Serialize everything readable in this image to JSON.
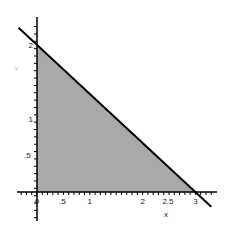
{
  "chart_data": {
    "type": "area",
    "title": "",
    "xlabel": "x",
    "ylabel": "y",
    "xlim": [
      -0.4,
      3.4
    ],
    "ylim": [
      -0.4,
      2.4
    ],
    "grid": false,
    "legend": null,
    "x_ticks": [
      {
        "value": 0,
        "label": "0"
      },
      {
        "value": 0.5,
        "label": ".5"
      },
      {
        "value": 1,
        "label": "1"
      },
      {
        "value": 2,
        "label": "2"
      },
      {
        "value": 2.5,
        "label": "2.5"
      },
      {
        "value": 3,
        "label": "3"
      }
    ],
    "y_ticks": [
      {
        "value": 0,
        "label": "0"
      },
      {
        "value": 0.5,
        "label": ".5"
      },
      {
        "value": 1,
        "label": "1"
      },
      {
        "value": 2,
        "label": "2"
      }
    ],
    "series": [
      {
        "name": "line",
        "kind": "line",
        "equation": "y = 2 - (2/3)x",
        "x": [
          -0.35,
          3.3
        ],
        "y": [
          2.2333,
          -0.2
        ],
        "color": "#000000"
      },
      {
        "name": "feasible-region",
        "kind": "polygon",
        "x": [
          0,
          0,
          3
        ],
        "y": [
          0,
          2,
          0
        ],
        "color": "#a9a9a9"
      }
    ]
  },
  "labels": {
    "x_axis": "x",
    "y_axis": "y"
  },
  "colors": {
    "shade": "#a9a9a9",
    "line": "#000000",
    "axis": "#000000"
  }
}
